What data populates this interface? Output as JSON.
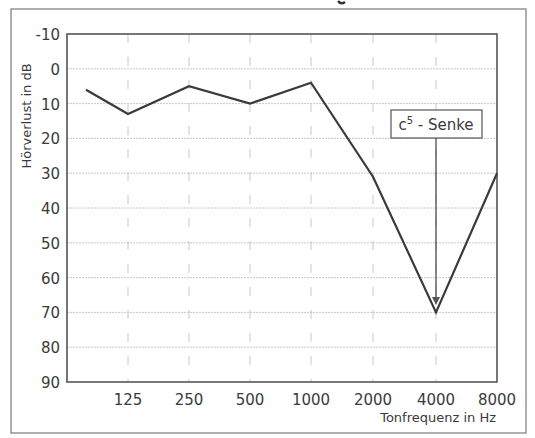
{
  "chart_data": {
    "type": "line",
    "title": "",
    "xlabel": "Tonfrequenz in Hz",
    "ylabel": "Hörverlust in dB",
    "x_tick_labels": [
      "125",
      "250",
      "500",
      "1000",
      "2000",
      "4000",
      "8000"
    ],
    "y_tick_labels": [
      "-10",
      "0",
      "10",
      "20",
      "30",
      "40",
      "50",
      "60",
      "70",
      "80",
      "90"
    ],
    "ylim": [
      -10,
      90
    ],
    "y_inverted": true,
    "grid": true,
    "series": [
      {
        "name": "Hörkurve",
        "x": [
          "<125",
          "125",
          "250",
          "500",
          "1000",
          "2000",
          "4000",
          "8000"
        ],
        "values": [
          6,
          13,
          5,
          10,
          4,
          31,
          70,
          30
        ]
      }
    ],
    "annotations": [
      {
        "text_base": "c",
        "text_sup": "5",
        "text_rest": " - Senke",
        "points_to": {
          "x": "4000",
          "y": 70
        }
      }
    ]
  },
  "colors": {
    "line": "#3a3a3a",
    "frame": "#6a6a6a",
    "grid": "#c8c8c8",
    "text": "#3a3a3a"
  }
}
